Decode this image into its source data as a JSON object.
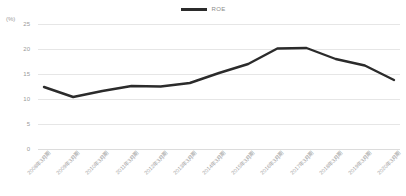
{
  "chart_data": {
    "type": "line",
    "title": "",
    "subtitle": "",
    "xlabel": "",
    "ylabel": "(%)",
    "ylim": [
      0,
      25
    ],
    "yticks": [
      0,
      5,
      10,
      15,
      20,
      25
    ],
    "grid": true,
    "legend_position": "top-center",
    "legend": [
      "ROE"
    ],
    "categories": [
      "2008年3月期",
      "2009年3月期",
      "2010年3月期",
      "2011年3月期",
      "2012年3月期",
      "2013年3月期",
      "2014年3月期",
      "2015年3月期",
      "2016年3月期",
      "2017年3月期",
      "2018年3月期",
      "2019年3月期",
      "2020年3月期"
    ],
    "series": [
      {
        "name": "ROE",
        "color": "#2b2b2b",
        "values": [
          12.4,
          10.4,
          11.6,
          12.6,
          12.5,
          13.2,
          15.2,
          17.0,
          20.1,
          20.2,
          18.0,
          16.7,
          13.8
        ]
      }
    ]
  },
  "legend": {
    "roe_label": "ROE",
    "swatch_name": "line-swatch"
  },
  "axis": {
    "y_unit": "(%)"
  },
  "colors": {
    "series": "#2b2b2b",
    "grid": "#e6e6e6",
    "tick_text": "#9a9a9a",
    "background": "#ffffff"
  }
}
